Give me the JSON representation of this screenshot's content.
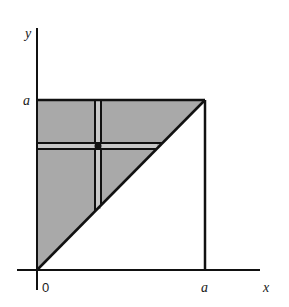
{
  "diagram": {
    "type": "region-of-integration",
    "colors": {
      "region_fill": "#a9a9a9",
      "line": "#111111",
      "background": "#ffffff"
    },
    "axes": {
      "x_label": "x",
      "y_label": "y",
      "origin_label": "0",
      "x_tick_label": "a",
      "y_tick_label": "a"
    },
    "region": {
      "vertices": [
        [
          0,
          0
        ],
        [
          0,
          "a"
        ],
        [
          "a",
          "a"
        ]
      ],
      "boundary_lines": [
        "x = 0",
        "y = a",
        "y = x",
        "x = a"
      ]
    },
    "strips": [
      {
        "orientation": "vertical",
        "from": "y = x",
        "to": "y = a"
      },
      {
        "orientation": "horizontal",
        "from": "x = 0",
        "to": "y = x"
      }
    ],
    "marked_point": "intersection of strips"
  }
}
